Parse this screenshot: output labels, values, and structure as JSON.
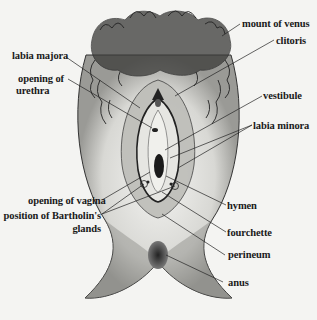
{
  "diagram": {
    "type": "anatomical-illustration",
    "colors": {
      "ink": "#1a1a1a",
      "background": "#f4f4f2"
    },
    "labels": {
      "mount_of_venus": "mount of venus",
      "clitoris": "clitoris",
      "labia_majora": "labia majora",
      "opening_of_urethra_1": "opening of",
      "opening_of_urethra_2": "urethra",
      "vestibule": "vestibule",
      "labia_minora": "labia minora",
      "opening_of_vagina": "opening of vagina",
      "bartholin_1": "position of Bartholin's",
      "bartholin_2": "glands",
      "hymen": "hymen",
      "fourchette": "fourchette",
      "perineum": "perineum",
      "anus": "anus"
    }
  }
}
